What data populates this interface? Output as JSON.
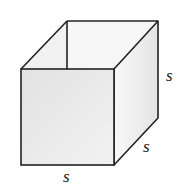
{
  "diagram": {
    "type": "open-top box (cube without lid)",
    "labels": {
      "front_bottom": "s",
      "right_bottom": "s",
      "right_side": "s"
    },
    "colors": {
      "stroke": "#222222",
      "front_face": "#e9e9e9",
      "right_face": "#efefef",
      "inner_back": "#f6f6f6",
      "inner_left": "#f0f0f0"
    }
  }
}
